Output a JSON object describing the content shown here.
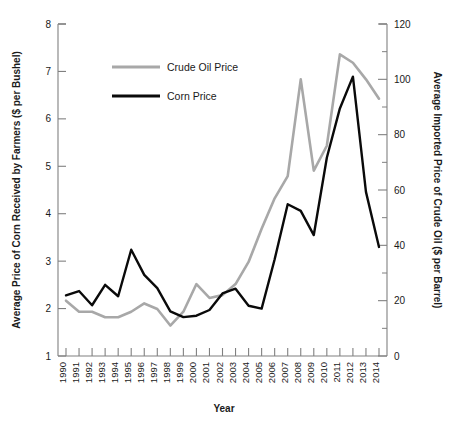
{
  "chart_data": {
    "type": "line",
    "title": "",
    "xlabel": "Year",
    "ylabel": "Average Price of Corn Received by Farmers  ($ per Bushel)",
    "y2label": "Average Imported Price of Crude Oil ($ per Barrel)",
    "x": [
      1990,
      1991,
      1992,
      1993,
      1994,
      1995,
      1996,
      1997,
      1998,
      1999,
      2000,
      2001,
      2002,
      2003,
      2004,
      2005,
      2006,
      2007,
      2008,
      2009,
      2010,
      2011,
      2012,
      2013,
      2014
    ],
    "xtick_labels": [
      "1990",
      "1991",
      "1992",
      "1993",
      "1994",
      "1995",
      "1996",
      "1997",
      "1998",
      "1999",
      "2000",
      "2001",
      "2002",
      "2003",
      "2004",
      "2005",
      "2006",
      "2007",
      "2008",
      "2009",
      "2010",
      "2011",
      "2012",
      "2013",
      "2014"
    ],
    "ylim": [
      1,
      8
    ],
    "ytick_labels": [
      "1",
      "2",
      "3",
      "4",
      "5",
      "6",
      "7",
      "8"
    ],
    "ytick_values": [
      1,
      2,
      3,
      4,
      5,
      6,
      7,
      8
    ],
    "y2lim": [
      0,
      120
    ],
    "y2tick_labels": [
      "0",
      "20",
      "40",
      "60",
      "80",
      "100",
      "120"
    ],
    "y2tick_values": [
      0,
      20,
      40,
      60,
      80,
      100,
      120
    ],
    "grid": false,
    "legend_position": "upper-left-inside",
    "series": [
      {
        "name": "Crude Oil Price",
        "axis": "right",
        "color": "#a8a8a8",
        "units": "$ per Barrel",
        "values": [
          20.0,
          16.0,
          16.0,
          14.0,
          14.0,
          16.0,
          19.0,
          17.0,
          11.0,
          16.0,
          26.0,
          21.0,
          22.0,
          26.0,
          34.0,
          46.0,
          57.0,
          65.0,
          100.0,
          67.0,
          76.0,
          109.0,
          106.0,
          100.0,
          93.0
        ]
      },
      {
        "name": "Corn Price",
        "axis": "left",
        "color": "#0a0a0a",
        "units": "$ per Bushel",
        "values": [
          2.28,
          2.37,
          2.07,
          2.5,
          2.26,
          3.24,
          2.71,
          2.43,
          1.94,
          1.82,
          1.85,
          1.97,
          2.32,
          2.42,
          2.06,
          2.0,
          3.04,
          4.2,
          4.06,
          3.55,
          5.18,
          6.22,
          6.89,
          4.46,
          3.3
        ]
      }
    ]
  },
  "legend": {
    "entries": [
      {
        "label": "Crude Oil Price",
        "color": "#a8a8a8"
      },
      {
        "label": "Corn Price",
        "color": "#0a0a0a"
      }
    ]
  },
  "axes": {
    "x_title": "Year",
    "y_left_title": "Average Price of Corn Received by Farmers  ($ per Bushel)",
    "y_right_title": "Average Imported Price of Crude Oil ($ per Barrel)"
  }
}
